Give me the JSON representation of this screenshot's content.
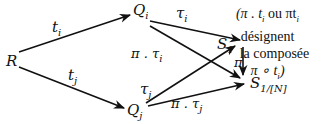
{
  "nodes": {
    "R": {
      "base": "R",
      "sub": ""
    },
    "Qi": {
      "base": "Q",
      "sub": "i"
    },
    "Qj": {
      "base": "Q",
      "sub": "j"
    },
    "S1_target": {
      "base": "S",
      "sub": "1"
    },
    "S1N": {
      "base": "S",
      "sub": "1/[N]"
    }
  },
  "edges": {
    "ti": {
      "from": "R",
      "to": "Qi",
      "label_base": "t",
      "label_sub": "i"
    },
    "tj": {
      "from": "R",
      "to": "Qj",
      "label_base": "t",
      "label_sub": "j"
    },
    "tau_i": {
      "from": "Qi",
      "to": "S1",
      "label_base": "τ",
      "label_sub": "i"
    },
    "pi_tau_i": {
      "from": "Qi",
      "to": "S1/[N]",
      "label_base": "π . τ",
      "label_sub": "i"
    },
    "tau_j": {
      "from": "Qj",
      "to": "S1",
      "label_base": "τ",
      "label_sub": "j"
    },
    "pi_tau_j": {
      "from": "Qj",
      "to": "S1/[N]",
      "label_base": "π . τ",
      "label_sub": "j"
    },
    "pi": {
      "from": "S1",
      "to": "S1/[N]",
      "label_base": "π",
      "label_sub": ""
    }
  },
  "annotation": {
    "line1_a": "(π . t",
    "line1_sub": "i",
    "line1_b": " ou πt",
    "line1_sub2": "i",
    "line2": "désignent",
    "line3": "la composée",
    "line4_a": "π ∘ t",
    "line4_sub": "i",
    "line4_b": ")"
  }
}
